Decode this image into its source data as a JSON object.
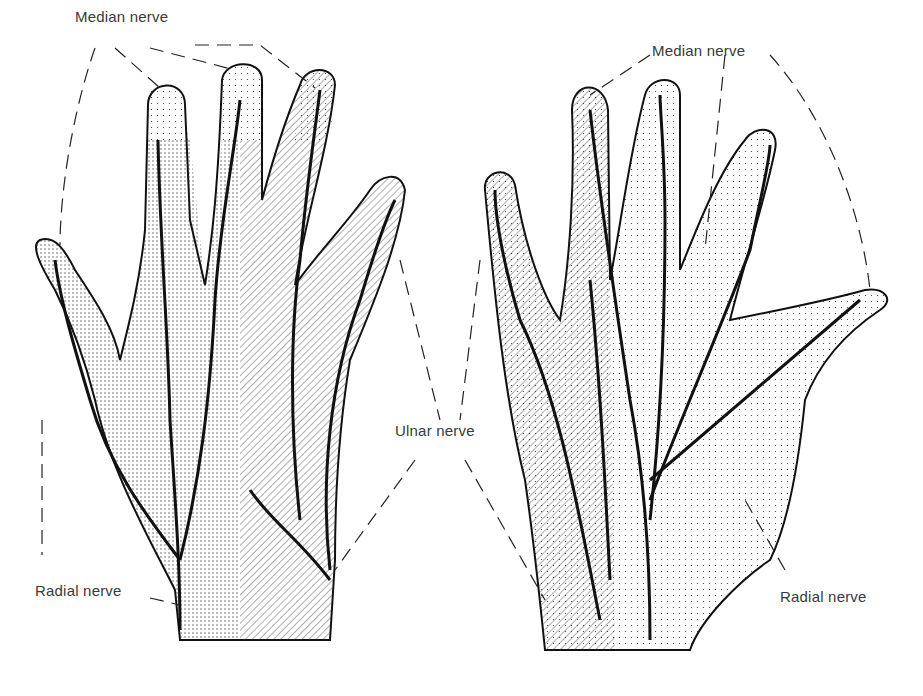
{
  "figure": {
    "colors": {
      "ink": "#1a1a1a",
      "label": "#3a3a3a",
      "paper": "#ffffff"
    },
    "labels": {
      "median_left": "Median nerve",
      "median_right": "Median nerve",
      "ulnar": "Ulnar nerve",
      "radial_left": "Radial nerve",
      "radial_right": "Radial nerve"
    },
    "views": [
      {
        "name": "dorsal-hand",
        "regions": [
          "Median nerve (stippled fingertips)",
          "Radial nerve (dense stipple)",
          "Ulnar nerve (hatched)"
        ]
      },
      {
        "name": "palmar-hand",
        "regions": [
          "Median nerve (light stipple)",
          "Ulnar nerve (hatched)",
          "Radial nerve (thenar stipple)"
        ]
      }
    ]
  }
}
